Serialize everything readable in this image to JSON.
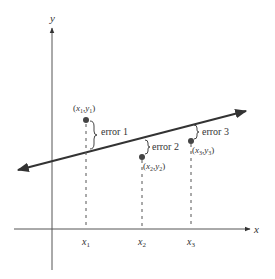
{
  "diagram": {
    "axes": {
      "x_label": "x",
      "y_label": "y"
    },
    "x_ticks": [
      {
        "label": "x",
        "sub": "1"
      },
      {
        "label": "x",
        "sub": "2"
      },
      {
        "label": "x",
        "sub": "3"
      }
    ],
    "points": [
      {
        "label": "(x1,y1)",
        "x": "x",
        "xs": "1",
        "y": "y",
        "ys": "1",
        "error_label": "error 1"
      },
      {
        "label": "(x2,y2)",
        "x": "x",
        "xs": "2",
        "y": "y",
        "ys": "2",
        "error_label": "error 2"
      },
      {
        "label": "(x3,y3)",
        "x": "x",
        "xs": "3",
        "y": "y",
        "ys": "3",
        "error_label": "error 3"
      }
    ],
    "colors": {
      "ink": "#333333",
      "point": "#444444",
      "dashes": "#555555"
    }
  }
}
